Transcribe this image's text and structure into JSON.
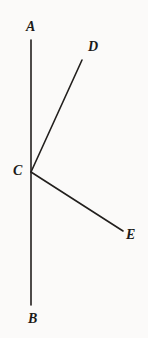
{
  "figure": {
    "type": "geometry-diagram",
    "width": 148,
    "height": 338,
    "background_color": "#fbfaf9",
    "stroke_color": "#221f1d",
    "label_color": "#1c1a18",
    "stroke_width": 1.6,
    "points": [
      {
        "id": "A",
        "label": "A",
        "x": 31,
        "y": 40,
        "label_x": 26,
        "label_y": 20
      },
      {
        "id": "B",
        "label": "B",
        "x": 31,
        "y": 305,
        "label_x": 28,
        "label_y": 312
      },
      {
        "id": "C",
        "label": "C",
        "x": 31,
        "y": 172,
        "label_x": 13,
        "label_y": 164
      },
      {
        "id": "D",
        "label": "D",
        "x": 82,
        "y": 60,
        "label_x": 88,
        "label_y": 40
      },
      {
        "id": "E",
        "label": "E",
        "x": 123,
        "y": 231,
        "label_x": 126,
        "label_y": 228
      }
    ],
    "segments": [
      {
        "id": "AB",
        "name": "line-ab",
        "from": "A",
        "to": "B",
        "x1": 31,
        "y1": 40,
        "x2": 31,
        "y2": 305
      },
      {
        "id": "CD",
        "name": "ray-cd",
        "from": "C",
        "to": "D",
        "x1": 31,
        "y1": 172,
        "x2": 82,
        "y2": 60
      },
      {
        "id": "CE",
        "name": "ray-ce",
        "from": "C",
        "to": "E",
        "x1": 31,
        "y1": 172,
        "x2": 123,
        "y2": 231
      }
    ]
  }
}
